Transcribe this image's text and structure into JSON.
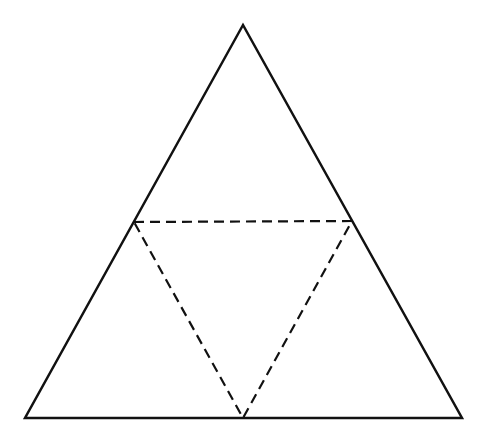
{
  "diagram": {
    "type": "triangle-net",
    "colors": {
      "background": "#ffffff",
      "stroke": "#111111"
    },
    "outer_triangle": {
      "style": "solid",
      "stroke_width": 2.5,
      "points": [
        [
          243,
          25
        ],
        [
          25,
          418
        ],
        [
          462,
          418
        ]
      ]
    },
    "inner_triangle": {
      "style": "dashed",
      "stroke_width": 2.2,
      "dash": "10,6",
      "points": [
        [
          134,
          222
        ],
        [
          352,
          221
        ],
        [
          243,
          418
        ]
      ]
    }
  }
}
